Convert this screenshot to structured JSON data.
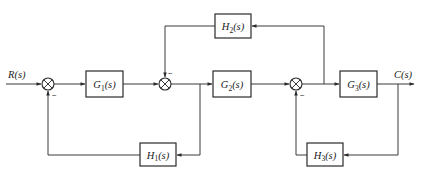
{
  "diagram": {
    "type": "control-system block diagram",
    "input_label": "R(s)",
    "output_label": "C(s)",
    "blocks": [
      {
        "id": "G1",
        "label": "G",
        "sub": "1",
        "arg": "(s)",
        "x": 86,
        "y": 71,
        "w": 37,
        "h": 26
      },
      {
        "id": "G2",
        "label": "G",
        "sub": "2",
        "arg": "(s)",
        "x": 213,
        "y": 71,
        "w": 38,
        "h": 26
      },
      {
        "id": "G3",
        "label": "G",
        "sub": "3",
        "arg": "(s)",
        "x": 340,
        "y": 71,
        "w": 37,
        "h": 26
      },
      {
        "id": "H1",
        "label": "H",
        "sub": "1",
        "arg": "(s)",
        "x": 140,
        "y": 143,
        "w": 36,
        "h": 23
      },
      {
        "id": "H2",
        "label": "H",
        "sub": "2",
        "arg": "(s)",
        "x": 215,
        "y": 14,
        "w": 36,
        "h": 24
      },
      {
        "id": "H3",
        "label": "H",
        "sub": "3",
        "arg": "(s)",
        "x": 307,
        "y": 143,
        "w": 36,
        "h": 23
      }
    ],
    "summing_junctions": [
      {
        "id": "S1",
        "cx": 48,
        "cy": 84,
        "r": 6,
        "feedback_sign": "−"
      },
      {
        "id": "S2",
        "cx": 165,
        "cy": 84,
        "r": 6,
        "feedback_sign": "−"
      },
      {
        "id": "S3",
        "cx": 296,
        "cy": 84,
        "r": 6,
        "feedback_sign": "−"
      }
    ],
    "connections": [
      "R(s) → S1",
      "S1 → G1",
      "G1 → S2",
      "S2 → G2",
      "G2 → S3",
      "S3 → G3",
      "G3 → C(s)",
      "branch after S2 → H1 → S1 (negative)",
      "branch after S3 → H2 → S2 (negative)",
      "branch at C(s) → H3 → S3 (negative)"
    ]
  }
}
